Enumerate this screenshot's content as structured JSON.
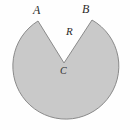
{
  "figure": {
    "kind": "geometry-diagram",
    "background_color": "#fefefe",
    "shape": {
      "name": "notched-disk",
      "fill_color": "#c9c9c9",
      "stroke_color": "#8a8a8a",
      "stroke_width": 1,
      "center": {
        "x": 64,
        "y": 63
      },
      "radius": 53,
      "notch": {
        "vertex": {
          "x": 64,
          "y": 63
        },
        "left_tip": {
          "x": 38,
          "y": 21
        },
        "right_tip": {
          "x": 92,
          "y": 20
        }
      }
    },
    "labels": [
      {
        "id": "A",
        "text": "A",
        "role": "notch-left-endpoint",
        "x": 36,
        "y": 10
      },
      {
        "id": "B",
        "text": "B",
        "role": "notch-right-endpoint",
        "x": 85,
        "y": 9
      },
      {
        "id": "R",
        "text": "R",
        "role": "radius",
        "x": 70,
        "y": 31
      },
      {
        "id": "C",
        "text": "C",
        "role": "center-vertex",
        "x": 64,
        "y": 71
      }
    ]
  }
}
